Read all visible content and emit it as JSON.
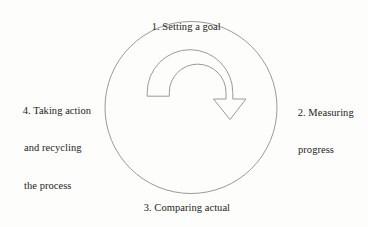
{
  "diagram": {
    "type": "circular-process",
    "background_color": "#fdfdfc",
    "line_color": "#8a8a8a",
    "text_color": "#242424",
    "circle": {
      "center_x": 191,
      "center_y": 107,
      "radius": 86
    },
    "arrow": {
      "name": "recycle-arrow",
      "direction": "clockwise",
      "description": "inverted-U curved band with arrowhead pointing down-right"
    },
    "steps": [
      {
        "number": "1.",
        "position": "top",
        "lines": [
          "1. Setting a goal"
        ]
      },
      {
        "number": "2.",
        "position": "right",
        "lines": [
          "2. Measuring",
          "progress"
        ]
      },
      {
        "number": "3.",
        "position": "bottom",
        "lines": [
          "3. Comparing actual",
          "with planned"
        ]
      },
      {
        "number": "4.",
        "position": "left",
        "lines": [
          "4. Taking action",
          "and recycling",
          "the process"
        ]
      }
    ]
  }
}
